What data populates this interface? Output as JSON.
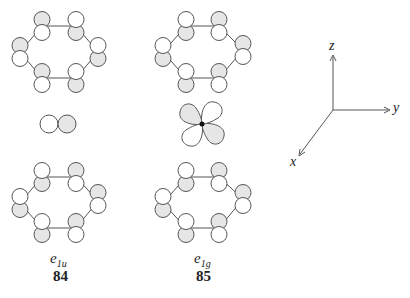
{
  "colors": {
    "shaded": "#e6e6e6",
    "line": "#555555",
    "unshaded": "#ffffff"
  },
  "orbitals": [
    {
      "symmetry_main": "e",
      "symmetry_sub": "1u",
      "number": "84",
      "center_label": "p-orbital"
    },
    {
      "symmetry_main": "e",
      "symmetry_sub": "1g",
      "number": "85",
      "center_label": "d-orbital"
    }
  ],
  "axes": {
    "z": "z",
    "y": "y",
    "x": "x"
  }
}
